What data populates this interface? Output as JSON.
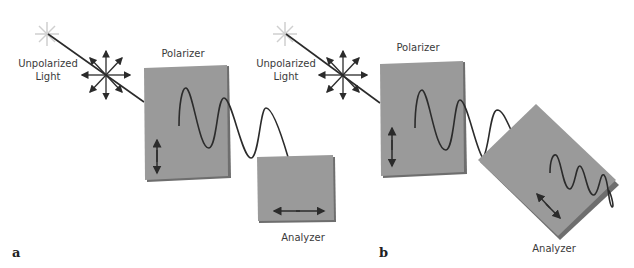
{
  "panels": [
    {
      "id": "a",
      "panel_label": "a",
      "source_label_line1": "Unpolarized",
      "source_label_line2": "Light",
      "polarizer_label": "Polarizer",
      "analyzer_label": "Analyzer",
      "polarizer_axis": "vertical",
      "analyzer_axis": "horizontal",
      "transmitted": "none"
    },
    {
      "id": "b",
      "panel_label": "b",
      "source_label_line1": "Unpolarized",
      "source_label_line2": "Light",
      "polarizer_label": "Polarizer",
      "analyzer_label": "Analyzer",
      "polarizer_axis": "vertical",
      "analyzer_axis": "diagonal",
      "transmitted": "partial"
    }
  ],
  "colors": {
    "plate": "#9a9a9a",
    "plate_edge": "#6e6e6e",
    "line": "#2b2b2b",
    "star": "#d8d8d8"
  }
}
